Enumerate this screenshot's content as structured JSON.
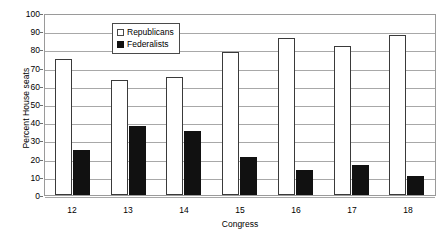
{
  "chart_data": {
    "type": "bar",
    "title": "",
    "xlabel": "Congress",
    "ylabel": "Percent House seats",
    "categories": [
      "12",
      "13",
      "14",
      "15",
      "16",
      "17",
      "18"
    ],
    "series": [
      {
        "name": "Republicans",
        "values": [
          75,
          63,
          65,
          78.5,
          86,
          82,
          88
        ],
        "color": "#ffffff",
        "edge_color": "#3a3a3a",
        "swatch": "open-square"
      },
      {
        "name": "Federalists",
        "values": [
          25,
          38,
          35,
          21,
          14,
          16.5,
          10.5
        ],
        "color": "#111111",
        "edge_color": "#111111",
        "swatch": "filled-square"
      }
    ],
    "ylim": [
      0,
      100
    ],
    "ytick_values": [
      0,
      10,
      20,
      30,
      40,
      50,
      60,
      70,
      80,
      90,
      100
    ],
    "ytick_labels": [
      "0",
      "10",
      "20",
      "30",
      "40",
      "50",
      "60",
      "70",
      "80",
      "90",
      "100"
    ],
    "grid": "horizontal",
    "grid_color": "#a8a8a8",
    "legend_position": "upper-center-left-inside",
    "plot_background": "#ffffff",
    "plot_border_color": "#9a9a9a"
  }
}
